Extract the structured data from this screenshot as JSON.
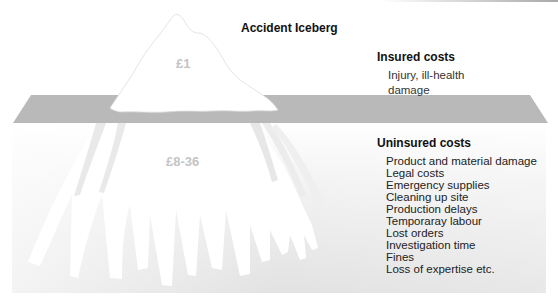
{
  "title": "Accident Iceberg",
  "above_water": {
    "amount": "£1",
    "heading": "Insured costs",
    "description": "Injury, ill-health damage"
  },
  "below_water": {
    "amount": "£8-36",
    "heading": "Uninsured costs",
    "items": [
      "Product and material damage",
      "Legal costs",
      "Emergency supplies",
      "Cleaning up site",
      "Production delays",
      "Temporaray labour",
      "Lost orders",
      "Investigation time",
      "Fines",
      "Loss of expertise etc."
    ]
  },
  "colors": {
    "water_band": "#b9b9b9",
    "underwater_bottom": "#e4e4e4",
    "iceberg": "#ffffff",
    "amount_text": "#c4c4c4",
    "text": "#111111"
  }
}
